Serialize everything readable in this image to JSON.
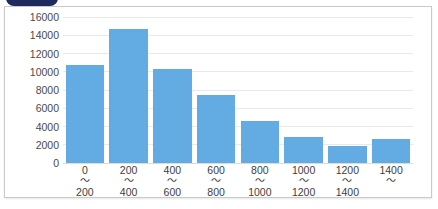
{
  "badge": {
    "name": "corner-tab-badge",
    "color": "#1f2a5e"
  },
  "card": {
    "border_color": "#c9c9c9",
    "background": "#ffffff"
  },
  "chart_data": {
    "type": "bar",
    "title": "",
    "subtitle": "",
    "xlabel": "",
    "ylabel": "",
    "grid": true,
    "legend": false,
    "bar_color": "#62ABE3",
    "gridline_color": "#e9e9e9",
    "ylim": [
      0,
      16000
    ],
    "yticks": [
      0,
      2000,
      4000,
      6000,
      8000,
      10000,
      12000,
      14000,
      16000
    ],
    "ytick_labels": [
      "0",
      "2000",
      "4000",
      "6000",
      "8000",
      "10000",
      "12000",
      "14000",
      "16000"
    ],
    "categories": [
      "0\n〜\n200",
      "200\n〜\n400",
      "400\n〜\n600",
      "600\n〜\n800",
      "800\n〜\n1000",
      "1000\n〜\n1200",
      "1200\n〜\n1400",
      "1400\n〜"
    ],
    "category_parts": [
      {
        "from": "0",
        "sep": "〜",
        "to": "200"
      },
      {
        "from": "200",
        "sep": "〜",
        "to": "400"
      },
      {
        "from": "400",
        "sep": "〜",
        "to": "600"
      },
      {
        "from": "600",
        "sep": "〜",
        "to": "800"
      },
      {
        "from": "800",
        "sep": "〜",
        "to": "1000"
      },
      {
        "from": "1000",
        "sep": "〜",
        "to": "1200"
      },
      {
        "from": "1200",
        "sep": "〜",
        "to": "1400"
      },
      {
        "from": "1400",
        "sep": "〜",
        "to": ""
      }
    ],
    "values": [
      10700,
      14700,
      10300,
      7400,
      4600,
      2800,
      1900,
      2600
    ]
  }
}
